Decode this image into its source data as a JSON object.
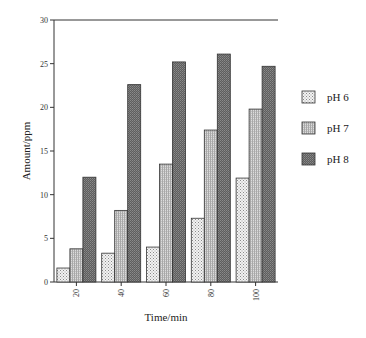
{
  "chart_data": {
    "type": "bar",
    "title": "",
    "xlabel": "Time/min",
    "ylabel": "Amount/ppm",
    "categories": [
      "20",
      "40",
      "60",
      "80",
      "100"
    ],
    "series": [
      {
        "name": "pH 6",
        "values": [
          1.6,
          3.3,
          4.0,
          7.3,
          11.9
        ],
        "pattern": "dots",
        "color": "#e6e6e6"
      },
      {
        "name": "pH 7",
        "values": [
          3.8,
          8.2,
          13.5,
          17.4,
          19.8
        ],
        "pattern": "vertical-lines",
        "color": "#c8c8c8"
      },
      {
        "name": "pH 8",
        "values": [
          12.0,
          22.6,
          25.2,
          26.1,
          24.7
        ],
        "pattern": "dense-dark",
        "color": "#6e6e6e"
      }
    ],
    "ylim": [
      0,
      30
    ],
    "yticks": [
      0,
      5,
      10,
      15,
      20,
      25,
      30
    ],
    "grid": false,
    "legend_position": "right",
    "x_tick_label_rotation": -90
  }
}
